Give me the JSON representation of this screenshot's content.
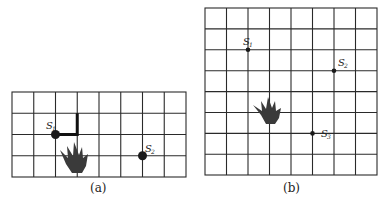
{
  "panels": [
    {
      "id": "a",
      "caption": "(a)",
      "grid": {
        "cols": 8,
        "rows": 4,
        "x0": 12,
        "y0": 92,
        "cell_w": 21.75,
        "cell_h": 21.25
      },
      "sensors": [
        {
          "label": "S",
          "sub": "1",
          "col": 2,
          "row": 2,
          "size": "large"
        },
        {
          "label": "S",
          "sub": "2",
          "col": 6,
          "row": 3,
          "size": "large"
        }
      ],
      "path": [
        [
          2,
          2
        ],
        [
          3,
          2
        ],
        [
          3,
          1
        ]
      ],
      "fire": {
        "cx": 75,
        "cy": 158
      }
    },
    {
      "id": "b",
      "caption": "(b)",
      "grid": {
        "cols": 8,
        "rows": 8,
        "x0": 205,
        "y0": 8,
        "cell_w": 21.5,
        "cell_h": 20.9
      },
      "sensors": [
        {
          "label": "S",
          "sub": "1",
          "col": 2,
          "row": 2,
          "size": "small"
        },
        {
          "label": "S",
          "sub": "2",
          "col": 6,
          "row": 3,
          "size": "small"
        },
        {
          "label": "S",
          "sub": "3",
          "col": 5,
          "row": 6,
          "size": "small"
        }
      ],
      "fire": {
        "cx": 268,
        "cy": 109
      }
    }
  ],
  "colors": {
    "grid": "#2a2a2a",
    "sensor": "#1a1a1a",
    "fire": "#3a3a3a",
    "path": "#111111"
  }
}
